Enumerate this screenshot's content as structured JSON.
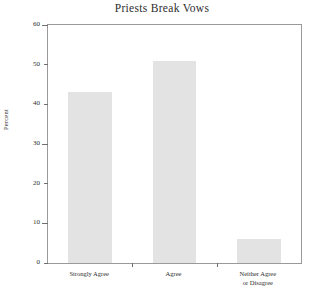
{
  "chart_data": {
    "type": "bar",
    "title": "Priests Break Vows",
    "xlabel": "",
    "ylabel": "Percent",
    "categories": [
      "Strongly Agree",
      "Agree",
      "Neither Agree\nor Disagree"
    ],
    "category_lines": [
      [
        "Strongly Agree"
      ],
      [
        "Agree"
      ],
      [
        "Neither Agree",
        "or Disagree"
      ]
    ],
    "values": [
      43,
      51,
      6
    ],
    "ylim": [
      0,
      60
    ],
    "yticks": [
      0,
      10,
      20,
      30,
      40,
      50,
      60
    ],
    "ytick_labels": [
      "0",
      "10",
      "20",
      "30",
      "40",
      "50",
      "60"
    ],
    "grid": false,
    "legend": null,
    "bar_color": "#e3e3e3",
    "axis_color": "#9a9a9a",
    "text_color": "#2e2e2e"
  }
}
